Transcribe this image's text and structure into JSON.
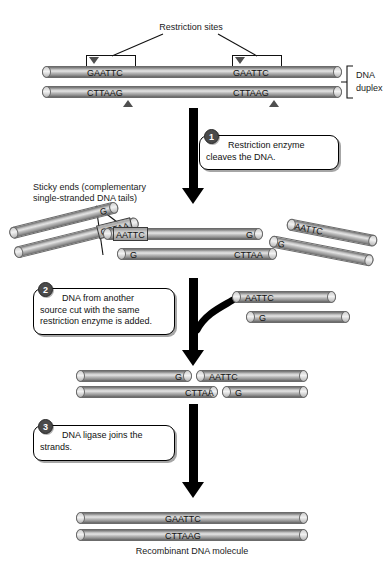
{
  "diagram": {
    "colors": {
      "strand": "#b0b0b0",
      "arrow": "#000000",
      "badge": "#4a4a4a",
      "background": "#ffffff"
    }
  },
  "labels": {
    "restriction_sites": "Restriction sites",
    "dna_duplex_line1": "DNA",
    "dna_duplex_line2": "duplex",
    "sticky_ends_line1": "Sticky ends (complementary",
    "sticky_ends_line2": "single-stranded DNA tails)",
    "recombinant": "Recombinant DNA molecule"
  },
  "steps": [
    {
      "number": "1",
      "line1": "Restriction enzyme",
      "line2": "cleaves the DNA.",
      "line3": ""
    },
    {
      "number": "2",
      "line1": "DNA from another",
      "line2": "source cut with the same",
      "line3": "restriction enzyme is added."
    },
    {
      "number": "3",
      "line1": "DNA ligase joins the",
      "line2": "strands.",
      "line3": ""
    }
  ],
  "duplex": {
    "top_site_left": "GAATTC",
    "top_site_right": "GAATTC",
    "bottom_site_left": "CTTAAG",
    "bottom_site_right": "CTTAAG"
  },
  "fragments": {
    "left_piece": {
      "top": "G",
      "bottom": "CTTAA"
    },
    "center_piece": {
      "top_left": "AATTC",
      "top_right": "G",
      "bottom_left": "G",
      "bottom_right": "CTTAA"
    },
    "right_piece": {
      "top": "AATTC",
      "bottom": "G"
    },
    "donor_piece": {
      "top": "AATTC",
      "bottom": "G"
    }
  },
  "annealed": {
    "top_left": "G",
    "top_right": "AATTC",
    "bottom_left": "CTTAA",
    "bottom_right": "G"
  },
  "product": {
    "top": "GAATTC",
    "bottom": "CTTAAG"
  }
}
